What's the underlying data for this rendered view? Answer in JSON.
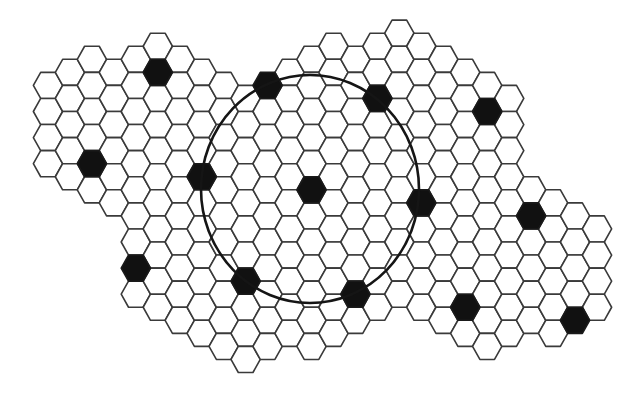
{
  "diagram": {
    "type": "hexagonal-grid",
    "hex_orientation": "flat-top",
    "colors": {
      "background": "#ffffff",
      "hex_fill": "#ffffff",
      "hex_stroke": "#3a3a3a",
      "filled_hex": "#111111",
      "circle_stroke": "#151515"
    },
    "grid": {
      "origin_x": 48.0,
      "origin_y": 46.25,
      "col_spacing": 21.96,
      "half_row_spacing": 13.05,
      "hex_half_width": 14.64,
      "hex_half_height": 13.05,
      "columns": [
        {
          "col": 0,
          "j_min": 3,
          "j_max": 9
        },
        {
          "col": 1,
          "j_min": 2,
          "j_max": 10
        },
        {
          "col": 2,
          "j_min": 1,
          "j_max": 11
        },
        {
          "col": 3,
          "j_min": 2,
          "j_max": 12
        },
        {
          "col": 4,
          "j_min": 1,
          "j_max": 19
        },
        {
          "col": 5,
          "j_min": 0,
          "j_max": 20
        },
        {
          "col": 6,
          "j_min": 1,
          "j_max": 21
        },
        {
          "col": 7,
          "j_min": 2,
          "j_max": 22
        },
        {
          "col": 8,
          "j_min": 3,
          "j_max": 23
        },
        {
          "col": 9,
          "j_min": 4,
          "j_max": 24
        },
        {
          "col": 10,
          "j_min": 3,
          "j_max": 23
        },
        {
          "col": 11,
          "j_min": 2,
          "j_max": 22
        },
        {
          "col": 12,
          "j_min": 1,
          "j_max": 23
        },
        {
          "col": 13,
          "j_min": 0,
          "j_max": 22
        },
        {
          "col": 14,
          "j_min": 1,
          "j_max": 21
        },
        {
          "col": 15,
          "j_min": 0,
          "j_max": 20
        },
        {
          "col": 16,
          "j_min": -1,
          "j_max": 19
        },
        {
          "col": 17,
          "j_min": 0,
          "j_max": 20
        },
        {
          "col": 18,
          "j_min": 1,
          "j_max": 21
        },
        {
          "col": 19,
          "j_min": 2,
          "j_max": 22
        },
        {
          "col": 20,
          "j_min": 3,
          "j_max": 23
        },
        {
          "col": 21,
          "j_min": 4,
          "j_max": 22
        },
        {
          "col": 22,
          "j_min": 11,
          "j_max": 21
        },
        {
          "col": 23,
          "j_min": 12,
          "j_max": 22
        },
        {
          "col": 24,
          "j_min": 13,
          "j_max": 21
        },
        {
          "col": 25,
          "j_min": 14,
          "j_max": 20
        }
      ],
      "filled_cells": [
        {
          "col": 5,
          "j": 2
        },
        {
          "col": 10,
          "j": 3
        },
        {
          "col": 15,
          "j": 4
        },
        {
          "col": 20,
          "j": 5
        },
        {
          "col": 2,
          "j": 9
        },
        {
          "col": 7,
          "j": 10
        },
        {
          "col": 12,
          "j": 11
        },
        {
          "col": 17,
          "j": 12
        },
        {
          "col": 22,
          "j": 13
        },
        {
          "col": 4,
          "j": 17
        },
        {
          "col": 9,
          "j": 18
        },
        {
          "col": 14,
          "j": 19
        },
        {
          "col": 19,
          "j": 20
        },
        {
          "col": 24,
          "j": 21
        }
      ]
    },
    "circle": {
      "cx": 310,
      "cy": 189,
      "rx": 109,
      "ry": 114,
      "description": "reuse-distance circle centered on filled cell"
    },
    "stats": {
      "total_filled_cells": 14,
      "filled_cells_on_circle": 6
    }
  }
}
